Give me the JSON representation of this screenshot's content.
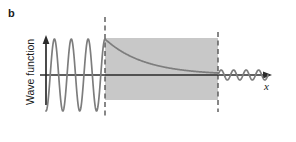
{
  "figure": {
    "panel_label": "b",
    "axis_label_y": "Wave function",
    "axis_label_x": "x",
    "background_color": "#ffffff"
  },
  "colors": {
    "barrier_fill": "#c8c8c8",
    "wave_stroke": "#7d7d7d",
    "axis_stroke": "#2b2b2b",
    "dashed_stroke": "#555555",
    "text": "#1a1a1a"
  },
  "chart_data": {
    "type": "line",
    "title": "",
    "xlabel": "x",
    "ylabel": "Wave function",
    "grid": false,
    "legend": null,
    "annotations": [
      {
        "name": "panel-letter",
        "text": "b"
      }
    ],
    "regions": [
      {
        "name": "barrier",
        "label": "",
        "x_start": 105,
        "x_end": 218,
        "fill": "#c8c8c8",
        "description": "Potential barrier region shaded gray"
      }
    ],
    "boundaries": [
      {
        "name": "barrier-left-edge",
        "x": 105,
        "style": "dashed"
      },
      {
        "name": "barrier-right-edge",
        "x": 218,
        "style": "dashed"
      }
    ],
    "series": [
      {
        "name": "incident-wave",
        "region": "left of barrier",
        "form": "sinusoid",
        "x_start": 46,
        "x_end": 105,
        "amplitude": 36,
        "cycles": 3.5,
        "baseline_y": 75
      },
      {
        "name": "decaying-wave",
        "region": "inside barrier",
        "form": "exponential decay",
        "x_start": 105,
        "x_end": 218,
        "amplitude_start": 36,
        "amplitude_end": 2,
        "baseline_y": 75
      },
      {
        "name": "transmitted-wave",
        "region": "right of barrier",
        "form": "sinusoid",
        "x_start": 218,
        "x_end": 268,
        "amplitude": 5,
        "cycles": 4,
        "baseline_y": 75
      }
    ],
    "axes": {
      "x_axis": {
        "from_x": 46,
        "to_x": 272,
        "y": 75,
        "arrow": true
      },
      "y_axis": {
        "x": 46,
        "from_y": 105,
        "to_y": 38,
        "arrow": true
      }
    }
  }
}
